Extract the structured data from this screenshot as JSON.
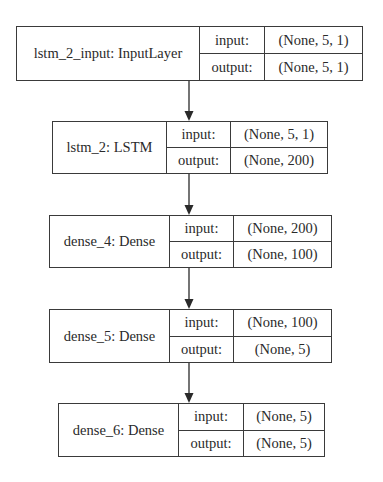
{
  "diagram": {
    "type": "keras-model-plot",
    "nodes": [
      {
        "name": "lstm_2_input: InputLayer",
        "input_label": "input:",
        "input_shape": "(None, 5, 1)",
        "output_label": "output:",
        "output_shape": "(None, 5, 1)"
      },
      {
        "name": "lstm_2: LSTM",
        "input_label": "input:",
        "input_shape": "(None, 5, 1)",
        "output_label": "output:",
        "output_shape": "(None, 200)"
      },
      {
        "name": "dense_4: Dense",
        "input_label": "input:",
        "input_shape": "(None, 200)",
        "output_label": "output:",
        "output_shape": "(None, 100)"
      },
      {
        "name": "dense_5: Dense",
        "input_label": "input:",
        "input_shape": "(None, 100)",
        "output_label": "output:",
        "output_shape": "(None, 5)"
      },
      {
        "name": "dense_6: Dense",
        "input_label": "input:",
        "input_shape": "(None, 5)",
        "output_label": "output:",
        "output_shape": "(None, 5)"
      }
    ],
    "edges": [
      {
        "from": "lstm_2_input",
        "to": "lstm_2"
      },
      {
        "from": "lstm_2",
        "to": "dense_4"
      },
      {
        "from": "dense_4",
        "to": "dense_5"
      },
      {
        "from": "dense_5",
        "to": "dense_6"
      }
    ]
  }
}
